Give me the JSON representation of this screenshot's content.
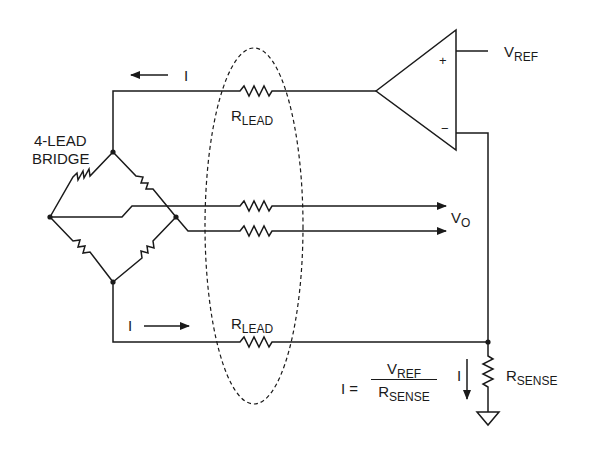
{
  "diagram": {
    "colors": {
      "line": "#1a1a1a",
      "background": "#ffffff"
    },
    "labels": {
      "bridge_line1": "4-LEAD",
      "bridge_line2": "BRIDGE",
      "current_top": "I",
      "current_bottom": "I",
      "current_sense": "I",
      "rlead_top_main": "R",
      "rlead_top_sub": "LEAD",
      "rlead_bottom_main": "R",
      "rlead_bottom_sub": "LEAD",
      "vref_main": "V",
      "vref_sub": "REF",
      "vo_main": "V",
      "vo_sub": "O",
      "rsense_main": "R",
      "rsense_sub": "SENSE",
      "opamp_plus": "+",
      "opamp_minus": "−"
    },
    "equation": {
      "lhs": "I =",
      "numerator_main": "V",
      "numerator_sub": "REF",
      "denominator_main": "R",
      "denominator_sub": "SENSE"
    },
    "components": [
      {
        "name": "op-amp",
        "type": "amplifier"
      },
      {
        "name": "bridge",
        "type": "wheatstone-bridge",
        "resistors": 4
      },
      {
        "name": "lead-resistors",
        "type": "resistor",
        "count": 4
      },
      {
        "name": "sense-resistor",
        "type": "resistor"
      },
      {
        "name": "ground",
        "type": "ground"
      }
    ]
  }
}
